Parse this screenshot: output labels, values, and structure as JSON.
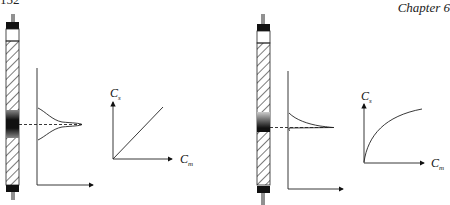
{
  "header": {
    "page_number": "152",
    "chapter": "Chapter 6"
  },
  "figures": [
    {
      "id": "linear-isotherm",
      "y_axis_label": "C",
      "y_axis_sub": "s",
      "x_axis_label": "C",
      "x_axis_sub": "m",
      "isotherm_shape": "linear",
      "peak_shape": "symmetric gaussian"
    },
    {
      "id": "langmuir-isotherm",
      "y_axis_label": "C",
      "y_axis_sub": "s",
      "x_axis_label": "C",
      "x_axis_sub": "m",
      "isotherm_shape": "convex (saturating)",
      "peak_shape": "tailing"
    }
  ],
  "colors": {
    "ink": "#1a1a1a",
    "background": "#ffffff"
  }
}
